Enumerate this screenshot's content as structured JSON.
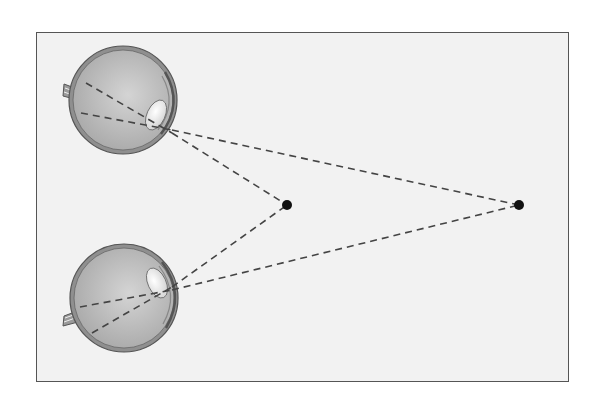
{
  "diagram": {
    "type": "binocular-convergence-illustration",
    "elements": {
      "top_eye": {
        "label": "",
        "icon": "eye-cross-section-icon"
      },
      "bottom_eye": {
        "label": "",
        "icon": "eye-cross-section-icon"
      },
      "near_point": {
        "label": ""
      },
      "far_point": {
        "label": ""
      }
    },
    "colors": {
      "frame_border": "#555555",
      "frame_bg": "#f2f2f2",
      "eye_fill": "#bcbcbc",
      "eye_outline": "#555555",
      "sightline": "#444444",
      "point": "#111111"
    }
  }
}
